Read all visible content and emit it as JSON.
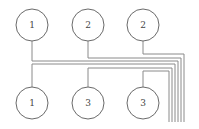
{
  "diagram": {
    "type": "node-wiring",
    "top_row": [
      {
        "id": "t1",
        "label": "1",
        "cx": 32,
        "cy": 25
      },
      {
        "id": "t2",
        "label": "2",
        "cx": 88,
        "cy": 25
      },
      {
        "id": "t3",
        "label": "2",
        "cx": 143,
        "cy": 25
      }
    ],
    "bottom_row": [
      {
        "id": "b1",
        "label": "1",
        "cx": 32,
        "cy": 103
      },
      {
        "id": "b2",
        "label": "3",
        "cx": 88,
        "cy": 103
      },
      {
        "id": "b3",
        "label": "3",
        "cx": 143,
        "cy": 103
      }
    ],
    "wire_bundle_count": 6
  }
}
